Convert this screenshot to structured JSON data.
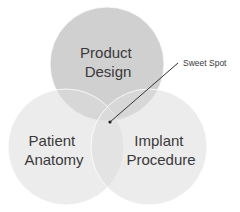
{
  "diagram": {
    "type": "venn",
    "circles": [
      {
        "id": "product-design",
        "label_lines": [
          "Product",
          "Design"
        ],
        "fill": "#c8c8c8",
        "opacity": 0.85,
        "cx": 107,
        "cy": 64,
        "r": 57
      },
      {
        "id": "patient-anatomy",
        "label_lines": [
          "Patient",
          "Anatomy"
        ],
        "fill": "#e2e2e2",
        "opacity": 0.6,
        "cx": 66,
        "cy": 147,
        "r": 58
      },
      {
        "id": "implant-procedure",
        "label_lines": [
          "Implant",
          "Procedure"
        ],
        "fill": "#e2e2e2",
        "opacity": 0.6,
        "cx": 149,
        "cy": 147,
        "r": 58
      }
    ],
    "callout": {
      "label": "Sweet Spot",
      "point": [
        110,
        122
      ],
      "line_end": [
        178,
        63
      ],
      "line_color": "#333333"
    },
    "text_color": "#3a3a3a",
    "background": "#ffffff"
  }
}
